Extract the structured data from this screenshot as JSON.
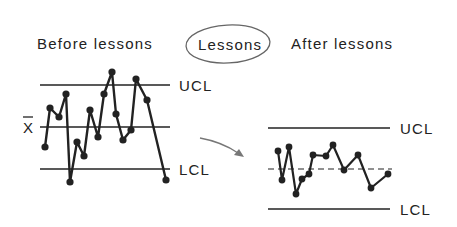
{
  "titles": {
    "before": "Before lessons",
    "middle": "Lessons",
    "after": "After lessons"
  },
  "labels": {
    "ucl": "UCL",
    "lcl": "LCL",
    "mean": "X"
  },
  "chart_data": [
    {
      "type": "line",
      "title": "Before lessons",
      "xlabel": "",
      "ylabel": "",
      "reference_lines": {
        "UCL": 85,
        "mean": 127,
        "LCL": 169
      },
      "line_style_mean": "solid",
      "points": [
        [
          45,
          147
        ],
        [
          50,
          108
        ],
        [
          59,
          117
        ],
        [
          66,
          94
        ],
        [
          70,
          182
        ],
        [
          77,
          142
        ],
        [
          84,
          156
        ],
        [
          90,
          110
        ],
        [
          98,
          137
        ],
        [
          104,
          94
        ],
        [
          112,
          72
        ],
        [
          116,
          114
        ],
        [
          123,
          140
        ],
        [
          131,
          130
        ],
        [
          136,
          79
        ],
        [
          147,
          100
        ],
        [
          166,
          180
        ]
      ],
      "line_extent": [
        40,
        170
      ],
      "grid": false
    },
    {
      "type": "line",
      "title": "After lessons",
      "xlabel": "",
      "ylabel": "",
      "reference_lines": {
        "UCL": 128,
        "mean": 169,
        "LCL": 209
      },
      "line_style_mean": "dashed",
      "points": [
        [
          278,
          151
        ],
        [
          282,
          180
        ],
        [
          289,
          147
        ],
        [
          296,
          194
        ],
        [
          302,
          179
        ],
        [
          309,
          174
        ],
        [
          313,
          155
        ],
        [
          326,
          156
        ],
        [
          333,
          145
        ],
        [
          344,
          170
        ],
        [
          358,
          155
        ],
        [
          371,
          188
        ],
        [
          388,
          174
        ]
      ],
      "line_extent": [
        268,
        390
      ],
      "grid": false
    }
  ],
  "colors": {
    "ink": "#222222",
    "arrow": "#777777",
    "ellipse": "#666666"
  }
}
